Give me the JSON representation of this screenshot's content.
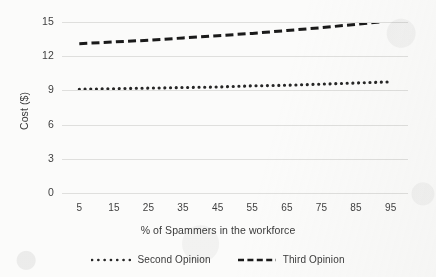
{
  "chart_data": {
    "type": "line",
    "title": "",
    "xlabel": "% of Spammers in the workforce",
    "ylabel": "Cost ($)",
    "x": [
      5,
      15,
      25,
      35,
      45,
      55,
      65,
      75,
      85,
      95
    ],
    "xtick_labels": [
      "5",
      "15",
      "25",
      "35",
      "45",
      "55",
      "65",
      "75",
      "85",
      "95"
    ],
    "ytick_labels": [
      "0",
      "3",
      "6",
      "9",
      "12",
      "15"
    ],
    "yticks": [
      0,
      3,
      6,
      9,
      12,
      15
    ],
    "ylim": [
      0,
      15
    ],
    "xlim": [
      0,
      100
    ],
    "grid": "horizontal",
    "legend_position": "bottom",
    "series": [
      {
        "name": "Second Opinion",
        "style": "dotted",
        "color": "#262626",
        "values": [
          9.1,
          9.15,
          9.2,
          9.25,
          9.3,
          9.4,
          9.45,
          9.55,
          9.65,
          9.75
        ]
      },
      {
        "name": "Third Opinion",
        "style": "dashed",
        "color": "#1a1a1a",
        "values": [
          13.1,
          13.25,
          13.4,
          13.6,
          13.8,
          14.0,
          14.25,
          14.5,
          14.8,
          15.1
        ]
      }
    ]
  },
  "legend": {
    "items": [
      {
        "label": "Second Opinion",
        "marker": "dotted-line-marker"
      },
      {
        "label": "Third Opinion",
        "marker": "dashed-line-marker"
      }
    ]
  },
  "colors": {
    "background": "#fbfbfa",
    "gridline": "#dfdfdd",
    "text": "#3a3a3a",
    "series_second_opinion": "#262626",
    "series_third_opinion": "#1a1a1a"
  }
}
